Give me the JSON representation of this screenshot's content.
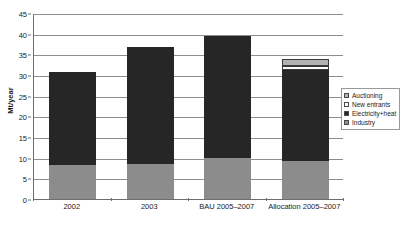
{
  "chart_data": {
    "type": "bar",
    "stacked": true,
    "title": "",
    "subtitle": "",
    "xlabel": "",
    "ylabel": "Mt/year",
    "ylim": [
      0,
      45
    ],
    "ytick_step": 5,
    "yticks": [
      "0",
      "5",
      "10",
      "15",
      "20",
      "25",
      "30",
      "35",
      "40",
      "45"
    ],
    "grid": true,
    "legend_position": "right",
    "categories": [
      "2002",
      "2003",
      "BAU 2005–2007",
      "Allocation 2005–2007"
    ],
    "series": [
      {
        "name": "Industry",
        "color": "#8c8c8c",
        "values": [
          8.2,
          8.5,
          10.0,
          9.2
        ]
      },
      {
        "name": "Electricity+heat",
        "color": "#262626",
        "values": [
          22.6,
          28.2,
          29.5,
          22.0
        ]
      },
      {
        "name": "New entrants",
        "color": "#ffffff",
        "values": [
          0,
          0,
          0,
          1.1
        ]
      },
      {
        "name": "Auctioning",
        "color": "#b3b3b3",
        "values": [
          0,
          0,
          0,
          1.5
        ]
      }
    ],
    "totals": [
      30.8,
      36.7,
      39.5,
      33.8
    ],
    "legend_entries": [
      "Auctioning",
      "New entrants",
      "Electricity+heat",
      "Industry"
    ]
  },
  "colors": {
    "industry": "#8c8c8c",
    "electricity_heat": "#262626",
    "new_entrants": "#ffffff",
    "auctioning": "#b3b3b3",
    "axis": "#6e6e6e",
    "grid": "#8f8f8f",
    "text": "#1a1a1a"
  }
}
